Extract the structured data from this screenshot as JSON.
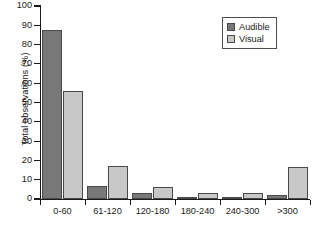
{
  "chart_data": {
    "type": "bar",
    "title": "",
    "xlabel": "",
    "ylabel": "Total observations (%)",
    "ylim": [
      0,
      100
    ],
    "ytick_values": [
      0,
      10,
      20,
      30,
      40,
      50,
      60,
      70,
      80,
      90,
      100
    ],
    "ytick_labels": [
      "0",
      "10",
      "20",
      "30",
      "40",
      "50",
      "60",
      "70",
      "80",
      "90",
      "100"
    ],
    "grid": false,
    "legend_position": "top-right",
    "categories": [
      "0-60",
      "61-120",
      "120-180",
      "180-240",
      "240-300",
      ">300"
    ],
    "series": [
      {
        "name": "Audible",
        "color": "#787878",
        "values": [
          87.5,
          7.0,
          3.2,
          1.0,
          1.0,
          2.3
        ]
      },
      {
        "name": "Visual",
        "color": "#c8c8c8",
        "values": [
          56.0,
          17.3,
          6.3,
          3.0,
          2.9,
          16.5
        ]
      }
    ]
  },
  "legend": {
    "items": [
      {
        "label": "Audible",
        "swatch": "dark-gray-swatch"
      },
      {
        "label": "Visual",
        "swatch": "light-gray-swatch"
      }
    ]
  },
  "colors": {
    "audible": "#787878",
    "visual": "#c8c8c8",
    "axis": "#1a1a1a",
    "bar_border": "#4a4a4a",
    "background": "#ffffff"
  }
}
